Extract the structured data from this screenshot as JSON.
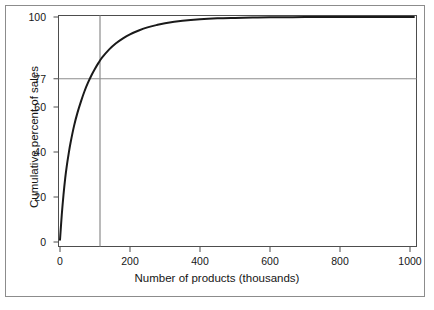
{
  "figure": {
    "background_color": "#ffffff",
    "frame_color": "#8c8c8c",
    "curve_color": "#1a1a1a",
    "reference_line_color": "#8c8c8c",
    "axis_color": "#4d4d4d"
  },
  "chart_data": {
    "type": "line",
    "title": "",
    "xlabel": "Number of products (thousands)",
    "ylabel": "Cumulative percent of sales",
    "xlim": [
      0,
      1010
    ],
    "ylim": [
      0,
      102
    ],
    "grid": false,
    "legend": null,
    "xticks": [
      0,
      200,
      400,
      600,
      800,
      1000
    ],
    "xticklabels": [
      "0",
      "200",
      "400",
      "600",
      "800",
      "1000"
    ],
    "yticks": [
      0,
      20,
      40,
      60,
      77,
      100
    ],
    "yticklabels": [
      "0",
      "20",
      "40",
      "60",
      "77",
      "100"
    ],
    "series": [
      {
        "name": "Cumulative percent of sales",
        "x": [
          0,
          5,
          10,
          15,
          20,
          25,
          30,
          40,
          50,
          60,
          70,
          80,
          90,
          100,
          110,
          120,
          140,
          160,
          180,
          200,
          225,
          250,
          275,
          300,
          350,
          400,
          450,
          500,
          550,
          600,
          700,
          800,
          900,
          1000,
          1010
        ],
        "y": [
          1.0,
          12.0,
          21.0,
          28.5,
          34.5,
          39.5,
          44.0,
          51.5,
          57.5,
          62.5,
          67.0,
          70.8,
          74.1,
          77.0,
          79.6,
          81.9,
          85.5,
          88.3,
          90.5,
          92.3,
          94.0,
          95.4,
          96.4,
          97.2,
          98.3,
          99.0,
          99.4,
          99.6,
          99.75,
          99.85,
          99.95,
          100.0,
          100.0,
          100.0,
          100.0
        ]
      }
    ],
    "reference_lines": [
      {
        "orientation": "vertical",
        "value": 100,
        "axis": "x",
        "color": "#8c8c8c",
        "label": ""
      },
      {
        "orientation": "horizontal",
        "value": 77,
        "axis": "y",
        "color": "#8c8c8c",
        "label": "77"
      }
    ],
    "annotations": [
      {
        "text": "77",
        "description": "highlighted y-axis tick marking the cumulative percent of sales at 100 thousand products"
      }
    ]
  }
}
